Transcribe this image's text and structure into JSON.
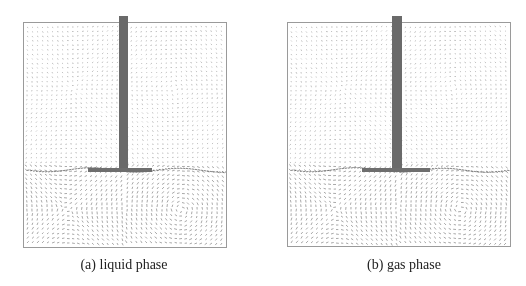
{
  "figure": {
    "panels": [
      {
        "id": "a",
        "caption": "(a) liquid phase",
        "description": "velocity vector field, liquid phase, stirred tank with central shaft and impeller"
      },
      {
        "id": "b",
        "caption": "(b) gas phase",
        "description": "velocity vector field, gas phase, stirred tank with central shaft and impeller"
      }
    ],
    "colors": {
      "vector": "#555555",
      "shaft": "#6a6a6a",
      "border": "#9a9a9a"
    }
  }
}
